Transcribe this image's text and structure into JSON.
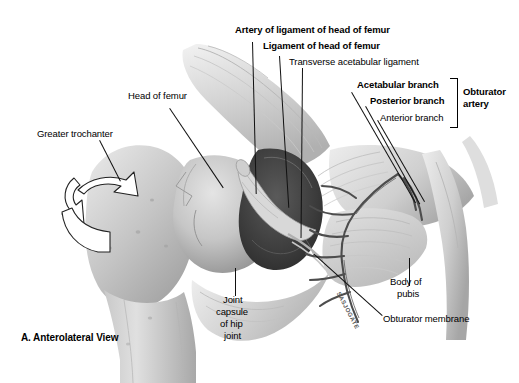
{
  "figure": {
    "caption": "A. Anterolateral View",
    "signature": "SASJOGATE"
  },
  "labels": {
    "artery_ligament_head_femur": "Artery of ligament of head of femur",
    "ligament_head_femur": "Ligament of head of femur",
    "transverse_acetabular_ligament": "Transverse acetabular ligament",
    "acetabular_branch": "Acetabular branch",
    "posterior_branch": "Posterior branch",
    "anterior_branch": "Anterior branch",
    "obturator_artery_l1": "Obturator",
    "obturator_artery_l2": "artery",
    "head_of_femur": "Head of femur",
    "greater_trochanter": "Greater trochanter",
    "joint_capsule_l1": "Joint",
    "joint_capsule_l2": "capsule",
    "joint_capsule_l3": "of hip",
    "joint_capsule_l4": "joint",
    "body_of_pubis_l1": "Body of",
    "body_of_pubis_l2": "pubis",
    "obturator_membrane": "Obturator membrane"
  },
  "colors": {
    "background": "#ffffff",
    "bone_light": "#dcdcdc",
    "bone_mid": "#bdbdbd",
    "bone_shadow": "#8f8f8f",
    "fossa_dark": "#3f3f3f",
    "vessel": "#4a4a4a",
    "line": "#111111",
    "text": "#000000"
  }
}
